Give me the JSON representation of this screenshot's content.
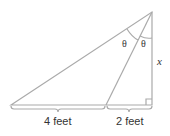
{
  "diagram": {
    "type": "right-triangle-angle-bisector",
    "labels": {
      "left_segment": "4 feet",
      "right_segment": "2 feet",
      "height": "x",
      "angle_left": "θ",
      "angle_right": "θ"
    },
    "colors": {
      "stroke": "#aaaaaa",
      "text": "#333333"
    }
  }
}
